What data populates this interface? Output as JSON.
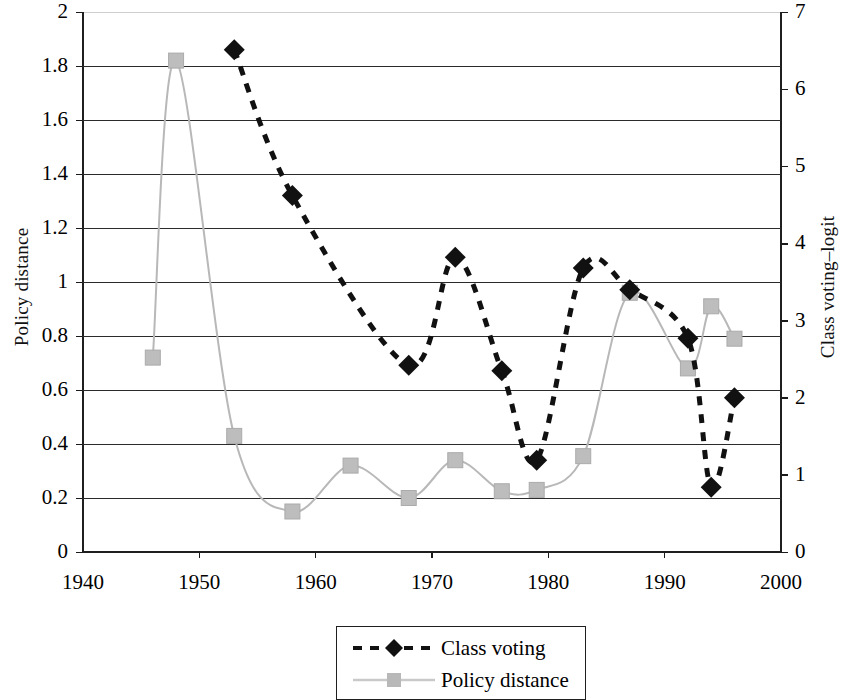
{
  "chart_data": {
    "type": "line",
    "title": "",
    "xlabel": "",
    "ylabel": "Policy distance",
    "y2label": "Class voting–logit",
    "xlim": [
      1940,
      2000
    ],
    "ylim": [
      0,
      2
    ],
    "y2lim": [
      0,
      7
    ],
    "grid": true,
    "legend_position": "bottom-center",
    "x_ticks": [
      "1940",
      "1950",
      "1960",
      "1970",
      "1980",
      "1990",
      "2000"
    ],
    "y_ticks": [
      "0",
      "0.2",
      "0.4",
      "0.6",
      "0.8",
      "1",
      "1.2",
      "1.4",
      "1.6",
      "1.8",
      "2"
    ],
    "y2_ticks": [
      "0",
      "1",
      "2",
      "3",
      "4",
      "5",
      "6",
      "7"
    ],
    "series": [
      {
        "name": "Class voting",
        "axis": "right",
        "marker": "diamond",
        "color": "#111111",
        "linestyle": "dashed",
        "x": [
          1953,
          1958,
          1968,
          1972,
          1976,
          1979,
          1983,
          1987,
          1992,
          1994,
          1996
        ],
        "values_left_scale": [
          1.86,
          1.32,
          0.69,
          1.09,
          0.67,
          0.34,
          1.05,
          0.97,
          0.79,
          0.24,
          0.57
        ],
        "values": [
          6.51,
          4.62,
          2.42,
          3.82,
          2.35,
          1.19,
          3.68,
          3.4,
          2.77,
          0.84,
          2.0
        ]
      },
      {
        "name": "Policy distance",
        "axis": "left",
        "marker": "square",
        "color": "#b8b8b8",
        "linestyle": "solid",
        "x": [
          1946,
          1948,
          1953,
          1958,
          1963,
          1968,
          1972,
          1976,
          1979,
          1983,
          1987,
          1992,
          1994,
          1996
        ],
        "values": [
          0.72,
          1.82,
          0.43,
          0.15,
          0.32,
          0.2,
          0.34,
          0.225,
          0.23,
          0.355,
          0.96,
          0.68,
          0.91,
          0.79
        ]
      }
    ]
  },
  "legend": {
    "items": [
      {
        "label": "Class voting",
        "marker": "diamond-dashed-black"
      },
      {
        "label": "Policy distance",
        "marker": "square-solid-gray"
      }
    ]
  }
}
